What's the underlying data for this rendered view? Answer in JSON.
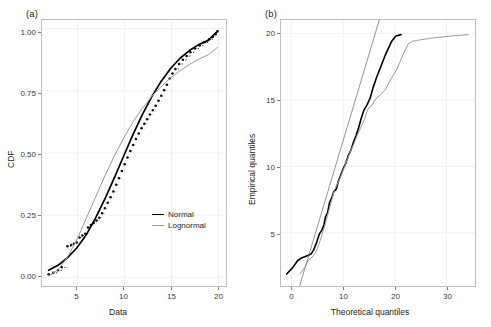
{
  "figure": {
    "background": "#ffffff",
    "width": 491,
    "height": 327
  },
  "colors": {
    "normal": "#000000",
    "lognormal": "#9a9a9a",
    "ecdf_points": "#111111",
    "grid": "#f0f0f0",
    "panel_border": "#bfbfbf",
    "text": "#231f20"
  },
  "panels": [
    {
      "id": "a",
      "label": "(a)",
      "chart_ref": 0
    },
    {
      "id": "b",
      "label": "(b)",
      "chart_ref": 1
    }
  ],
  "chart_data": [
    {
      "type": "line",
      "panel": "(a)",
      "title": "",
      "xlabel": "Data",
      "ylabel": "CDF",
      "xlim": [
        1.2,
        20.8
      ],
      "ylim": [
        -0.035,
        1.035
      ],
      "xticks": [
        5,
        10,
        15,
        20
      ],
      "xtick_labels": [
        "5",
        "10",
        "15",
        "20"
      ],
      "yticks": [
        0.0,
        0.25,
        0.5,
        0.75,
        1.0
      ],
      "ytick_labels": [
        "0.00",
        "0.25",
        "0.50",
        "0.75",
        "1.00"
      ],
      "grid": true,
      "legend": {
        "position": "inside-right-lower",
        "entries": [
          {
            "name": "Normal",
            "color": "#000000",
            "linewidth": 1.7
          },
          {
            "name": "Lognormal",
            "color": "#9a9a9a",
            "linewidth": 1.1
          }
        ]
      },
      "series": [
        {
          "name": "Empirical CDF",
          "style": "step-points",
          "color": "#111111",
          "x": [
            1.9,
            2.4,
            2.9,
            3.3,
            3.9,
            4.3,
            4.6,
            4.9,
            5.2,
            5.5,
            5.8,
            6.1,
            6.4,
            6.7,
            7.0,
            7.3,
            7.6,
            7.9,
            8.2,
            8.5,
            8.8,
            9.1,
            9.4,
            9.7,
            10.0,
            10.3,
            10.6,
            10.9,
            11.2,
            11.5,
            11.8,
            12.1,
            12.4,
            12.7,
            13.0,
            13.3,
            13.6,
            13.9,
            14.2,
            14.5,
            14.8,
            15.1,
            15.4,
            15.8,
            16.2,
            16.6,
            17.0,
            17.5,
            18.0,
            18.5,
            19.0,
            19.4,
            19.7,
            19.9
          ],
          "y": [
            0.012,
            0.018,
            0.028,
            0.04,
            0.125,
            0.13,
            0.135,
            0.14,
            0.16,
            0.168,
            0.175,
            0.2,
            0.21,
            0.218,
            0.228,
            0.24,
            0.258,
            0.278,
            0.3,
            0.322,
            0.345,
            0.372,
            0.398,
            0.428,
            0.455,
            0.482,
            0.508,
            0.532,
            0.556,
            0.578,
            0.6,
            0.618,
            0.636,
            0.655,
            0.672,
            0.69,
            0.71,
            0.73,
            0.752,
            0.775,
            0.8,
            0.82,
            0.838,
            0.858,
            0.875,
            0.89,
            0.905,
            0.92,
            0.932,
            0.945,
            0.958,
            0.968,
            0.978,
            0.99
          ]
        },
        {
          "name": "Normal",
          "style": "smooth",
          "color": "#000000",
          "x": [
            1.9,
            2.9,
            3.9,
            4.9,
            5.9,
            6.9,
            7.9,
            8.9,
            9.9,
            10.9,
            11.9,
            12.9,
            13.9,
            14.9,
            15.9,
            16.9,
            17.9,
            18.9,
            19.9
          ],
          "y": [
            0.028,
            0.048,
            0.078,
            0.118,
            0.17,
            0.238,
            0.315,
            0.4,
            0.488,
            0.575,
            0.655,
            0.727,
            0.789,
            0.84,
            0.881,
            0.912,
            0.936,
            0.953,
            0.99
          ]
        },
        {
          "name": "Lognormal",
          "style": "smooth",
          "color": "#9a9a9a",
          "x": [
            1.9,
            2.9,
            3.9,
            4.9,
            5.9,
            6.9,
            7.9,
            8.9,
            9.9,
            10.9,
            11.9,
            12.9,
            13.9,
            14.9,
            15.9,
            16.9,
            17.9,
            18.9,
            19.9
          ],
          "y": [
            0.005,
            0.03,
            0.08,
            0.15,
            0.235,
            0.322,
            0.408,
            0.488,
            0.56,
            0.625,
            0.68,
            0.728,
            0.768,
            0.802,
            0.831,
            0.856,
            0.877,
            0.895,
            0.925
          ]
        }
      ]
    },
    {
      "type": "line",
      "panel": "(b)",
      "title": "",
      "xlabel": "Theoretical quantiles",
      "ylabel": "Empirical quantiles",
      "xlim": [
        -2.0,
        35.5
      ],
      "ylim": [
        1.0,
        21.0
      ],
      "xticks": [
        0,
        10,
        20,
        30
      ],
      "xtick_labels": [
        "0",
        "10",
        "20",
        "30"
      ],
      "yticks": [
        5,
        10,
        15,
        20
      ],
      "ytick_labels": [
        "5",
        "10",
        "15",
        "20"
      ],
      "grid": true,
      "legend": {
        "position": "none",
        "entries": []
      },
      "series": [
        {
          "name": "Normal QQ",
          "style": "step-line",
          "color": "#000000",
          "x": [
            -0.9,
            0.3,
            1.2,
            1.9,
            2.6,
            3.2,
            3.8,
            4.3,
            4.9,
            5.4,
            5.9,
            6.3,
            6.6,
            7.0,
            7.4,
            7.8,
            8.2,
            8.7,
            9.1,
            9.6,
            10.0,
            10.5,
            11.0,
            11.5,
            12.0,
            12.5,
            13.0,
            13.5,
            14.0,
            14.6,
            15.2,
            15.8,
            16.4,
            17.0,
            17.6,
            18.2,
            18.8,
            19.4,
            20.2,
            21.2
          ],
          "y": [
            1.9,
            2.4,
            2.9,
            3.1,
            3.2,
            3.3,
            3.4,
            3.7,
            4.3,
            4.9,
            5.2,
            5.6,
            6.2,
            6.5,
            7.3,
            7.6,
            8.1,
            8.3,
            8.9,
            9.4,
            9.8,
            10.2,
            10.8,
            11.2,
            11.8,
            12.3,
            12.9,
            13.6,
            14.2,
            14.6,
            15.1,
            15.9,
            16.6,
            17.2,
            17.8,
            18.4,
            18.9,
            19.4,
            19.8,
            19.9
          ]
        },
        {
          "name": "Lognormal QQ",
          "style": "step-line",
          "color": "#9a9a9a",
          "x": [
            1.7,
            2.6,
            3.2,
            3.8,
            4.3,
            4.8,
            5.3,
            5.8,
            6.2,
            6.6,
            7.0,
            7.4,
            7.9,
            8.3,
            8.8,
            9.3,
            9.8,
            10.3,
            10.9,
            11.5,
            12.1,
            12.8,
            13.4,
            14.1,
            14.8,
            15.6,
            16.4,
            17.3,
            18.2,
            19.3,
            20.4,
            21.6,
            22.6,
            23.4,
            24.2,
            24.8,
            26.5,
            28.5,
            31.0,
            34.2
          ],
          "y": [
            1.9,
            2.4,
            2.9,
            3.1,
            3.3,
            3.6,
            4.1,
            4.7,
            5.2,
            5.7,
            6.3,
            6.9,
            7.6,
            8.2,
            8.6,
            9.0,
            9.5,
            10.0,
            10.6,
            11.2,
            11.7,
            12.4,
            12.9,
            13.5,
            14.3,
            14.6,
            15.1,
            15.4,
            15.8,
            16.6,
            17.3,
            18.4,
            19.2,
            19.4,
            19.45,
            19.5,
            19.6,
            19.7,
            19.8,
            19.9
          ]
        },
        {
          "name": "Reference line",
          "style": "thin-line",
          "color": "#666666",
          "x": [
            1.6,
            17.0
          ],
          "y": [
            1.0,
            21.0
          ]
        }
      ]
    }
  ]
}
